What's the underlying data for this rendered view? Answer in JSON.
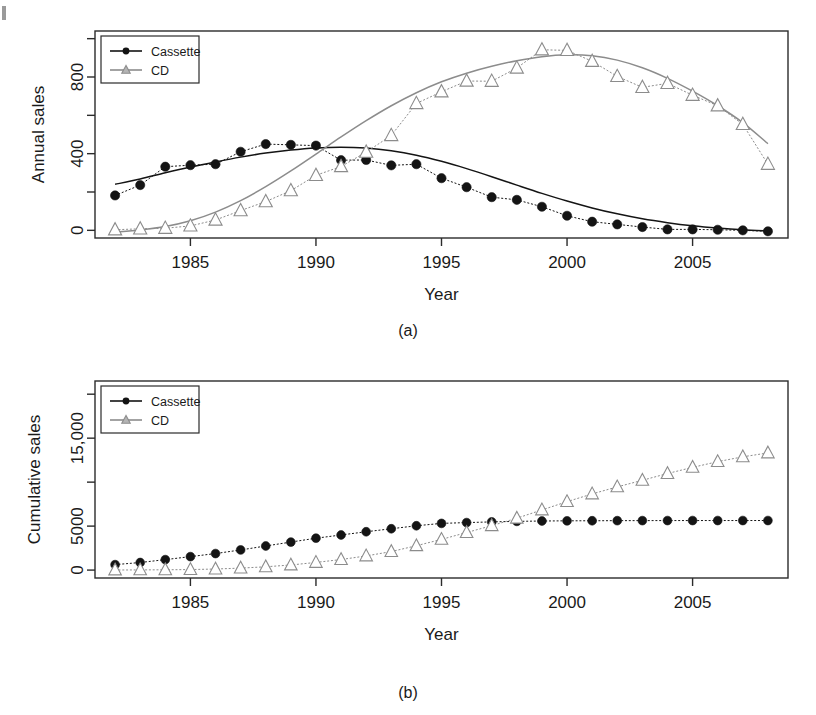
{
  "figure": {
    "panels": [
      {
        "id": "a",
        "panel_label": "(a)",
        "ylabel": "Annual sales",
        "xlabel": "Year"
      },
      {
        "id": "b",
        "panel_label": "(b)",
        "ylabel": "Cumulative sales",
        "xlabel": "Year"
      }
    ],
    "legend": {
      "entries": [
        {
          "label": "Cassette",
          "marker": "filled-circle",
          "color": "#141414"
        },
        {
          "label": "CD",
          "marker": "open-triangle",
          "color": "#8c8c8c"
        }
      ]
    },
    "colors": {
      "cassette": "#141414",
      "cd": "#8c8c8c",
      "frame": "#2b2b2b",
      "background": "#ffffff"
    }
  },
  "chart_data": [
    {
      "type": "scatter",
      "id": "panel-a",
      "title": "",
      "subtitle": "(a)",
      "xlabel": "Year",
      "ylabel": "Annual sales",
      "xlim": [
        1981.2,
        2008.8
      ],
      "ylim": [
        -40,
        1040
      ],
      "xticks": [
        1985,
        1990,
        1995,
        2000,
        2005
      ],
      "xticklabels": [
        "1985",
        "1990",
        "1995",
        "2000",
        "2005"
      ],
      "yticks": [
        0,
        200,
        400,
        600,
        800,
        1000
      ],
      "yticklabels": [
        "0",
        "",
        "400",
        "",
        "800",
        ""
      ],
      "grid": false,
      "legend_position": "top-left",
      "x": [
        1982,
        1983,
        1984,
        1985,
        1986,
        1987,
        1988,
        1989,
        1990,
        1991,
        1992,
        1993,
        1994,
        1995,
        1996,
        1997,
        1998,
        1999,
        2000,
        2001,
        2002,
        2003,
        2004,
        2005,
        2006,
        2007,
        2008
      ],
      "series": [
        {
          "name": "Cassette",
          "marker": "filled-circle",
          "color": "#141414",
          "values": [
            182,
            236,
            332,
            340,
            345,
            410,
            450,
            446,
            442,
            366,
            367,
            339,
            345,
            272,
            225,
            173,
            159,
            123,
            76,
            45,
            31,
            17,
            5,
            5,
            3,
            0,
            -5
          ],
          "fit": [
            240,
            268,
            300,
            330,
            357,
            382,
            403,
            419,
            430,
            434,
            429,
            415,
            392,
            360,
            322,
            280,
            236,
            193,
            153,
            117,
            86,
            60,
            40,
            24,
            12,
            3,
            -3
          ]
        },
        {
          "name": "CD",
          "marker": "open-triangle",
          "color": "#8c8c8c",
          "values": [
            3,
            8,
            11,
            23,
            54,
            103,
            150,
            207,
            287,
            333,
            408,
            495,
            662,
            723,
            779,
            778,
            847,
            942,
            939,
            882,
            803,
            746,
            767,
            705,
            650,
            553,
            345
          ],
          "fit": [
            -10,
            2,
            20,
            50,
            95,
            155,
            228,
            310,
            398,
            487,
            572,
            650,
            718,
            775,
            820,
            856,
            885,
            906,
            916,
            911,
            888,
            848,
            793,
            726,
            650,
            562,
            452
          ]
        }
      ]
    },
    {
      "type": "scatter",
      "id": "panel-b",
      "title": "",
      "subtitle": "(b)",
      "xlabel": "Year",
      "ylabel": "Cumulative sales",
      "xlim": [
        1981.2,
        2008.8
      ],
      "ylim": [
        -900,
        21500
      ],
      "xticks": [
        1985,
        1990,
        1995,
        2000,
        2005
      ],
      "xticklabels": [
        "1985",
        "1990",
        "1995",
        "2000",
        "2005"
      ],
      "yticks": [
        0,
        5000,
        10000,
        15000,
        20000
      ],
      "yticklabels": [
        "0",
        "5000",
        "",
        "15,000",
        ""
      ],
      "grid": false,
      "legend_position": "top-left",
      "x": [
        1982,
        1983,
        1984,
        1985,
        1986,
        1987,
        1988,
        1989,
        1990,
        1991,
        1992,
        1993,
        1994,
        1995,
        1996,
        1997,
        1998,
        1999,
        2000,
        2001,
        2002,
        2003,
        2004,
        2005,
        2006,
        2007,
        2008
      ],
      "series": [
        {
          "name": "Cassette",
          "marker": "filled-circle",
          "color": "#141414",
          "values": [
            620,
            860,
            1190,
            1530,
            1880,
            2290,
            2740,
            3185,
            3625,
            3990,
            4360,
            4700,
            5040,
            5310,
            5400,
            5480,
            5540,
            5580,
            5600,
            5610,
            5620,
            5625,
            5630,
            5632,
            5634,
            5635,
            5635
          ]
        },
        {
          "name": "CD",
          "marker": "open-triangle",
          "color": "#8c8c8c",
          "values": [
            10,
            20,
            35,
            60,
            120,
            225,
            375,
            580,
            870,
            1200,
            1610,
            2105,
            2770,
            3490,
            4270,
            5050,
            5900,
            6840,
            7780,
            8660,
            9460,
            10210,
            10980,
            11680,
            12330,
            12880,
            13320
          ]
        }
      ]
    }
  ]
}
